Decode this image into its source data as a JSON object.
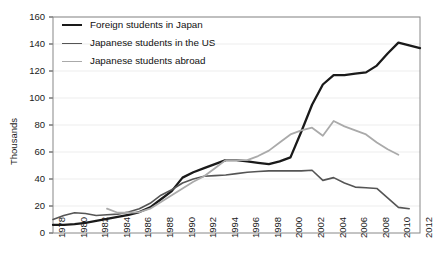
{
  "chart_data": {
    "type": "line",
    "title": "",
    "xlabel": "",
    "ylabel": "Thousands",
    "xlim": [
      1978,
      2012
    ],
    "ylim": [
      0,
      160
    ],
    "ytick_step": 20,
    "xtick_step": 2,
    "grid": true,
    "legend_position": "top-left",
    "ytick_labels": [
      "0",
      "20",
      "40",
      "60",
      "80",
      "100",
      "120",
      "140",
      "160"
    ],
    "ytick_values": [
      0,
      20,
      40,
      60,
      80,
      100,
      120,
      140,
      160
    ],
    "xtick_labels": [
      "1978",
      "1980",
      "1982",
      "1984",
      "1986",
      "1988",
      "1990",
      "1992",
      "1994",
      "1996",
      "1998",
      "2000",
      "2002",
      "2004",
      "2006",
      "2008",
      "2010",
      "2012"
    ],
    "xtick_values": [
      1978,
      1980,
      1982,
      1984,
      1986,
      1988,
      1990,
      1992,
      1994,
      1996,
      1998,
      2000,
      2002,
      2004,
      2006,
      2008,
      2010,
      2012
    ],
    "series": [
      {
        "name": "Foreign students in Japan",
        "color": "#1a1a1a",
        "width": 2.3,
        "x": [
          1978,
          1979,
          1980,
          1981,
          1982,
          1983,
          1984,
          1985,
          1986,
          1987,
          1988,
          1989,
          1990,
          1991,
          1992,
          1993,
          1994,
          1995,
          1996,
          1997,
          1998,
          1999,
          2000,
          2001,
          2002,
          2003,
          2004,
          2005,
          2006,
          2007,
          2008,
          2009,
          2010,
          2011,
          2012
        ],
        "values": [
          6,
          6,
          6.5,
          7.5,
          9,
          10.5,
          12,
          13.5,
          15.5,
          19,
          25,
          31,
          41,
          45,
          48,
          51,
          54,
          54,
          53,
          52,
          51,
          53,
          56,
          75,
          95,
          110,
          117,
          117,
          118,
          119,
          124,
          133,
          141,
          139,
          137
        ]
      },
      {
        "name": "Japanese students in the US",
        "color": "#555555",
        "width": 1.6,
        "x": [
          1978,
          1979,
          1980,
          1981,
          1982,
          1983,
          1984,
          1985,
          1986,
          1987,
          1988,
          1989,
          1990,
          1991,
          1992,
          1993,
          1994,
          1995,
          1996,
          1997,
          1998,
          1999,
          2000,
          2001,
          2002,
          2003,
          2004,
          2005,
          2006,
          2007,
          2008,
          2009,
          2010,
          2011
        ],
        "values": [
          10,
          13,
          15,
          14.5,
          13,
          13.5,
          14,
          15.5,
          18,
          22,
          28,
          32,
          37,
          40,
          42,
          42.5,
          43,
          44,
          45,
          45.5,
          46,
          46,
          46,
          46,
          46.5,
          39,
          41,
          37,
          34,
          33.5,
          33,
          26,
          19,
          18
        ]
      },
      {
        "name": "Japanese students abroad",
        "color": "#aaaaaa",
        "width": 1.8,
        "x": [
          1983,
          1984,
          1985,
          1986,
          1987,
          1988,
          1989,
          1990,
          1991,
          1992,
          1993,
          1994,
          1995,
          1996,
          1997,
          1998,
          1999,
          2000,
          2001,
          2002,
          2003,
          2004,
          2005,
          2006,
          2007,
          2008,
          2009,
          2010
        ],
        "values": [
          18,
          15,
          15,
          15.5,
          18,
          23,
          28,
          33,
          38,
          42,
          48,
          54,
          54,
          54,
          57,
          61,
          67,
          73,
          76,
          78,
          72,
          83,
          79,
          76,
          73,
          67,
          62,
          58
        ]
      }
    ]
  },
  "legend": {
    "items": [
      {
        "label": "Foreign students in Japan",
        "color": "#1a1a1a",
        "thickness": "2.6px"
      },
      {
        "label": "Japanese students in the US",
        "color": "#555555",
        "thickness": "1.7px"
      },
      {
        "label": "Japanese students abroad",
        "color": "#aaaaaa",
        "thickness": "1.7px"
      }
    ]
  },
  "axis": {
    "y_title": "Thousands"
  }
}
